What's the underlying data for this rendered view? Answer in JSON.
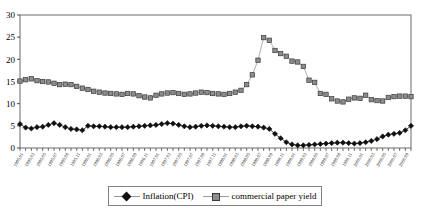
{
  "chart_data": {
    "type": "line",
    "title": "",
    "xlabel": "",
    "ylabel": "",
    "ylim": [
      0,
      30
    ],
    "yticks": [
      0,
      5,
      10,
      15,
      20,
      25,
      30
    ],
    "grid": false,
    "legend_position": "bottom",
    "x": [
      "1995.01",
      "1995.02",
      "1995.03",
      "1995.04",
      "1995.05",
      "1995.06",
      "1995.07",
      "1995.08",
      "1995.09",
      "1995.10",
      "1995.11",
      "1995.12",
      "1996.01",
      "1996.02",
      "1996.03",
      "1996.04",
      "1996.05",
      "1996.06",
      "1996.07",
      "1996.08",
      "1996.09",
      "1996.10",
      "1996.11",
      "1996.12",
      "1997.01",
      "1997.02",
      "1997.03",
      "1997.04",
      "1997.05",
      "1997.06",
      "1997.07",
      "1997.08",
      "1997.09",
      "1997.10",
      "1997.11",
      "1997.12",
      "1998.01",
      "1998.02",
      "1998.03",
      "1998.04",
      "1998.05",
      "1998.06",
      "1998.07",
      "1998.08",
      "1998.09",
      "1998.10",
      "1998.11",
      "1998.12",
      "1999.01",
      "1999.02",
      "1999.03",
      "1999.04",
      "1999.05",
      "1999.06",
      "1999.07",
      "1999.08",
      "1999.09",
      "1999.10",
      "1999.11",
      "1999.12",
      "2000.01",
      "2000.02",
      "2000.03",
      "2000.04",
      "2000.05",
      "2000.06",
      "2000.07",
      "2000.08",
      "2000.09",
      "2000.10"
    ],
    "xtick_labels": [
      "1995.01",
      "1995.03",
      "1995.05",
      "1995.07",
      "1995.09",
      "1995.11",
      "1996.01",
      "1996.03",
      "1996.05",
      "1996.07",
      "1996.09",
      "1996.11",
      "1997.01",
      "1997.03",
      "1997.05",
      "1997.07",
      "1997.09",
      "1997.11",
      "1998.01",
      "1998.03",
      "1998.05",
      "1998.07",
      "1998.09",
      "1998.11",
      "1999.01",
      "1999.03",
      "1999.05",
      "1999.07",
      "1999.09",
      "1999.11",
      "2000.01",
      "2000.03",
      "2000.05",
      "2000.07",
      "2000.09"
    ],
    "series": [
      {
        "name": "Inflation(CPI)",
        "marker": "diamond",
        "color": "#101010",
        "line_color": "#101010",
        "values": [
          5.4,
          4.6,
          4.4,
          4.7,
          4.8,
          5.2,
          5.6,
          5.2,
          4.7,
          4.3,
          4.2,
          4.0,
          5.0,
          4.9,
          4.9,
          4.8,
          4.7,
          4.7,
          4.7,
          4.7,
          4.8,
          4.9,
          5.0,
          5.1,
          5.2,
          5.4,
          5.6,
          5.5,
          5.2,
          4.9,
          4.7,
          4.8,
          5.0,
          5.1,
          5.0,
          4.9,
          4.8,
          4.7,
          4.7,
          4.9,
          5.0,
          4.9,
          4.8,
          4.6,
          4.3,
          3.2,
          2.2,
          1.3,
          0.8,
          0.6,
          0.6,
          0.7,
          0.8,
          0.9,
          1.0,
          1.1,
          1.2,
          1.2,
          1.1,
          1.0,
          1.1,
          1.3,
          1.6,
          2.0,
          2.6,
          3.0,
          3.2,
          3.4,
          4.0,
          5.0
        ]
      },
      {
        "name": "commercial paper yield",
        "marker": "square",
        "color": "#8c8c8c",
        "line_color": "#9a9a9a",
        "values": [
          15.1,
          15.4,
          15.6,
          15.2,
          15.0,
          14.9,
          14.6,
          14.3,
          14.4,
          14.3,
          13.9,
          13.5,
          13.2,
          12.8,
          12.6,
          12.4,
          12.3,
          12.2,
          12.1,
          12.3,
          12.2,
          11.8,
          11.5,
          11.3,
          11.9,
          12.2,
          12.4,
          12.5,
          12.3,
          12.1,
          12.2,
          12.4,
          12.6,
          12.5,
          12.3,
          12.2,
          12.1,
          12.3,
          12.6,
          13.0,
          14.3,
          16.5,
          19.8,
          24.9,
          24.3,
          22.0,
          21.3,
          20.7,
          19.6,
          19.4,
          18.4,
          15.3,
          14.8,
          12.3,
          12.1,
          11.1,
          10.6,
          10.4,
          11.0,
          11.3,
          11.2,
          11.9,
          10.9,
          10.7,
          10.6,
          11.4,
          11.6,
          11.7,
          11.7,
          11.6
        ]
      }
    ]
  },
  "legend": {
    "items": [
      {
        "label": "Inflation(CPI)",
        "marker": "diamond"
      },
      {
        "label": "commercial paper yield",
        "marker": "square"
      }
    ]
  }
}
